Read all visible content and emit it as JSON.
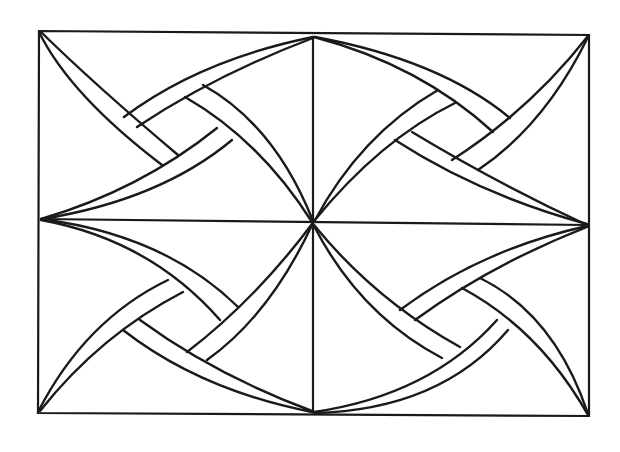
{
  "drawing": {
    "title": "Celtic knot weave line drawing",
    "stroke_color": "#1a1a1a",
    "background": "#ffffff",
    "frame": {
      "outer": [
        [
          39,
          31
        ],
        [
          589,
          35
        ],
        [
          589,
          416
        ],
        [
          38,
          413
        ]
      ],
      "vertical_divider": [
        [
          313,
          36
        ],
        [
          313,
          413
        ]
      ],
      "horizontal_divider": [
        [
          40,
          219
        ],
        [
          588,
          225
        ]
      ]
    },
    "ribbons": [
      {
        "quadrant": "top-left",
        "name": "tl-from-corner",
        "a": "M39,32 Q70,95 162,165",
        "b": "M41,32 Q95,85 178,155"
      },
      {
        "quadrant": "top-left",
        "name": "tl-from-top",
        "a": "M313,37 Q200,60 124,117",
        "b": "M313,38 Q215,75 137,127"
      },
      {
        "quadrant": "top-left",
        "name": "tl-from-center",
        "a": "M312,222 Q260,140 185,97",
        "b": "M313,221 Q275,125 203,85"
      },
      {
        "quadrant": "top-left",
        "name": "tl-from-left",
        "a": "M41,219 Q140,190 217,128",
        "b": "M42,219 Q160,200 232,140"
      },
      {
        "quadrant": "top-right",
        "name": "tr-from-top",
        "a": "M314,37 Q420,65 493,132",
        "b": "M315,37 Q440,60 510,118"
      },
      {
        "quadrant": "top-right",
        "name": "tr-from-corner",
        "a": "M588,36 Q530,110 452,160",
        "b": "M588,37 Q545,125 478,170"
      },
      {
        "quadrant": "top-right",
        "name": "tr-from-center",
        "a": "M314,222 Q360,135 438,90",
        "b": "M314,221 Q380,140 455,103"
      },
      {
        "quadrant": "top-right",
        "name": "tr-from-right",
        "a": "M587,224 Q480,195 395,140",
        "b": "M587,225 Q500,185 412,132"
      },
      {
        "quadrant": "bottom-left",
        "name": "bl-from-left",
        "a": "M41,220 Q150,240 220,320",
        "b": "M41,219 Q165,235 238,307"
      },
      {
        "quadrant": "bottom-left",
        "name": "bl-from-center",
        "a": "M312,224 Q255,300 187,352",
        "b": "M312,225 Q270,315 207,360"
      },
      {
        "quadrant": "bottom-left",
        "name": "bl-from-corner",
        "a": "M38,412 Q85,320 168,280",
        "b": "M40,411 Q100,335 183,292"
      },
      {
        "quadrant": "bottom-left",
        "name": "bl-from-bottom",
        "a": "M312,412 Q200,390 123,330",
        "b": "M312,411 Q215,375 140,320"
      },
      {
        "quadrant": "bottom-right",
        "name": "br-from-right",
        "a": "M587,226 Q480,250 400,310",
        "b": "M587,227 Q490,265 415,320"
      },
      {
        "quadrant": "bottom-right",
        "name": "br-from-center",
        "a": "M314,225 Q375,300 460,347",
        "b": "M314,226 Q360,315 442,358"
      },
      {
        "quadrant": "bottom-right",
        "name": "br-from-corner",
        "a": "M588,415 Q540,330 462,288",
        "b": "M588,414 Q555,315 480,278"
      },
      {
        "quadrant": "bottom-right",
        "name": "br-from-bottom",
        "a": "M314,412 Q430,395 497,320",
        "b": "M314,413 Q440,410 508,330"
      }
    ]
  }
}
